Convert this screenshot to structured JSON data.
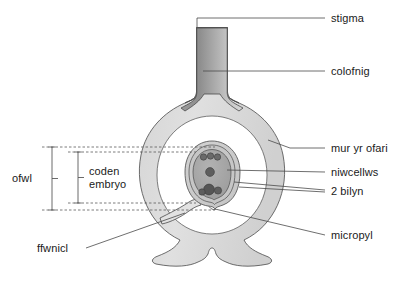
{
  "diagram": {
    "language": "cy",
    "background_color": "#ffffff",
    "line_color": "#3c3c3c",
    "text_color": "#1a1a1a",
    "fills": {
      "ovary_wall": "#dcdcdc",
      "ovary_cavity": "#ffffff",
      "style_dark": "#8a8a8a",
      "style_light": "#d2d2d2",
      "ovule_outer": "#d0d0d0",
      "ovule_inner": "#b8b8b8",
      "embryo_sac": "#a8a8a8",
      "nucleus": "#6e6e6e",
      "antipodal": "#5a5a5a"
    }
  },
  "labels": {
    "stigma": "stigma",
    "colofnig": "colofnig",
    "mur_yr_ofari": "mur yr ofari",
    "niwcellws": "niwcellws",
    "dau_bilyn": "2 bilyn",
    "micropyl": "micropyl",
    "ffwnicl": "ffwnicl",
    "ofwl": "ofwl",
    "coden_embryo_line1": "coden",
    "coden_embryo_line2": "embryo"
  },
  "structures": [
    {
      "name": "stigma",
      "label": "stigma",
      "side": "right"
    },
    {
      "name": "style",
      "label": "colofnig",
      "side": "right"
    },
    {
      "name": "ovary-wall",
      "label": "mur yr ofari",
      "side": "right"
    },
    {
      "name": "nucellus",
      "label": "niwcellws",
      "side": "right"
    },
    {
      "name": "two-integuments",
      "label": "2 bilyn",
      "side": "right"
    },
    {
      "name": "micropyle",
      "label": "micropyl",
      "side": "right"
    },
    {
      "name": "funicle",
      "label": "ffwnicl",
      "side": "left"
    },
    {
      "name": "ovule",
      "label": "ofwl",
      "side": "left"
    },
    {
      "name": "embryo-sac",
      "label": "coden embryo",
      "side": "left"
    }
  ]
}
